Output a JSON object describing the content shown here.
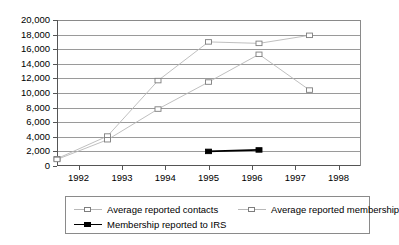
{
  "chart_data": {
    "type": "line",
    "title": "",
    "xlabel": "",
    "ylabel": "",
    "x": [
      "1992",
      "1993",
      "1994",
      "1995",
      "1996",
      "1997",
      "1998"
    ],
    "xlim": [
      "1992",
      "1998"
    ],
    "ylim": [
      0,
      20000
    ],
    "ytick_step": 2000,
    "ytick_labels": [
      "20,000",
      "18,000",
      "16,000",
      "14,000",
      "12,000",
      "10,000",
      "8,000",
      "6,000",
      "4,000",
      "2,000",
      "0"
    ],
    "ytick_values": [
      20000,
      18000,
      16000,
      14000,
      12000,
      10000,
      8000,
      6000,
      4000,
      2000,
      0
    ],
    "grid": true,
    "legend_position": "bottom",
    "series": [
      {
        "name": "Average reported contacts",
        "marker": "open-square",
        "color": "#b8b8b8",
        "x": [
          "1992",
          "1993",
          "1994",
          "1995",
          "1996",
          "1997"
        ],
        "values": [
          1000,
          4100,
          11700,
          17000,
          16800,
          17900
        ]
      },
      {
        "name": "Average reported membership",
        "marker": "open-square",
        "color": "#b8b8b8",
        "x": [
          "1992",
          "1993",
          "1994",
          "1995",
          "1996",
          "1997"
        ],
        "values": [
          900,
          3600,
          7800,
          11500,
          15300,
          10400
        ]
      },
      {
        "name": "Membership reported to IRS",
        "marker": "filled-square",
        "color": "#000000",
        "x": [
          "1995",
          "1996"
        ],
        "values": [
          2000,
          2200
        ]
      }
    ]
  },
  "legend": {
    "items": [
      {
        "label": "Average reported contacts"
      },
      {
        "label": "Average reported membership"
      },
      {
        "label": "Membership reported to IRS"
      }
    ]
  },
  "axis": {
    "y_labels": [
      "20,000",
      "18,000",
      "16,000",
      "14,000",
      "12,000",
      "10,000",
      "8,000",
      "6,000",
      "4,000",
      "2,000",
      "0"
    ],
    "x_labels": [
      "1992",
      "1993",
      "1994",
      "1995",
      "1996",
      "1997",
      "1998"
    ]
  }
}
